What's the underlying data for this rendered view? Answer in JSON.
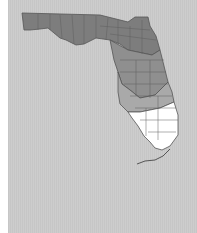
{
  "map": {
    "region": "Florida",
    "background_color": "#cbcbcb",
    "border_color": "#555555",
    "legend": [],
    "shading": [
      {
        "zone": "north-panhandle",
        "color": "#7d7d7d"
      },
      {
        "zone": "central",
        "color": "#8f8f8f"
      },
      {
        "zone": "central-south",
        "color": "#a9a9a9"
      },
      {
        "zone": "south",
        "color": "#ffffff"
      }
    ]
  }
}
